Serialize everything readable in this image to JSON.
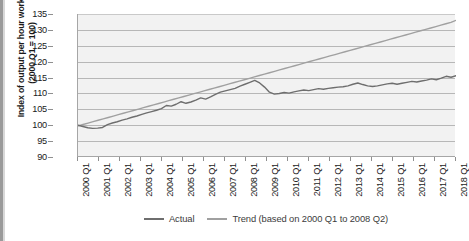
{
  "chart_data": {
    "type": "line",
    "title": "",
    "xlabel": "",
    "ylabel": "Index of output per hour worked (2000 Q1 = 100)",
    "ylabel_line1": "Index of output per hour worked",
    "ylabel_line2": "(2000 Q1 = 100)",
    "ylim": [
      90,
      135
    ],
    "yticks": [
      90,
      95,
      100,
      105,
      110,
      115,
      120,
      125,
      130,
      135
    ],
    "xlim": [
      "2000 Q1",
      "2018 Q1"
    ],
    "xticks": [
      "2000 Q1",
      "2001 Q1",
      "2002 Q1",
      "2003 Q1",
      "2004 Q1",
      "2005 Q1",
      "2006 Q1",
      "2007 Q1",
      "2008 Q1",
      "2009 Q1",
      "2010 Q1",
      "2011 Q1",
      "2012 Q1",
      "2013 Q1",
      "2014 Q1",
      "2015 Q1",
      "2016 Q1",
      "2017 Q1",
      "2018 Q1"
    ],
    "grid": true,
    "grid_axis": "y",
    "legend_position": "bottom-center",
    "plot_background": "#f2f2f2",
    "series": [
      {
        "name": "Actual",
        "color": "#6e6e6e",
        "x_start": "2000 Q1",
        "x_step_label": "quarterly",
        "values": [
          100.0,
          99.6,
          99.2,
          99.0,
          99.1,
          99.3,
          100.2,
          100.7,
          101.1,
          101.6,
          102.0,
          102.5,
          102.9,
          103.4,
          103.9,
          104.3,
          104.7,
          105.2,
          106.2,
          106.0,
          106.6,
          107.4,
          106.9,
          107.3,
          107.9,
          108.6,
          108.2,
          108.9,
          109.7,
          110.4,
          110.8,
          111.2,
          111.6,
          112.3,
          112.9,
          113.5,
          114.1,
          113.3,
          112.0,
          110.4,
          109.8,
          110.0,
          110.3,
          110.1,
          110.5,
          110.8,
          111.1,
          110.9,
          111.2,
          111.5,
          111.3,
          111.6,
          111.8,
          112.0,
          112.1,
          112.4,
          112.9,
          113.3,
          112.8,
          112.4,
          112.2,
          112.4,
          112.7,
          113.0,
          113.2,
          112.9,
          113.2,
          113.5,
          113.8,
          113.6,
          113.9,
          114.2,
          114.6,
          114.3,
          114.8,
          115.4,
          115.1,
          115.6
        ]
      },
      {
        "name": "Trend (based on 2000 Q1 to 2008 Q2)",
        "color": "#a0a0a0",
        "x_start": "2000 Q1",
        "description": "Linear trend extrapolated from 2000 Q1 to 2008 Q2, continuing to 2018 Q1",
        "start_value": 99.8,
        "end_value": 133.0,
        "values": [
          99.8,
          100.24,
          100.68,
          101.12,
          101.56,
          102.0,
          102.44,
          102.88,
          103.32,
          103.76,
          104.2,
          104.64,
          105.08,
          105.52,
          105.96,
          106.4,
          106.84,
          107.28,
          107.72,
          108.16,
          108.6,
          109.04,
          109.48,
          109.92,
          110.36,
          110.8,
          111.24,
          111.68,
          112.12,
          112.56,
          113.0,
          113.44,
          113.88,
          114.32,
          114.76,
          115.2,
          115.64,
          116.08,
          116.52,
          116.96,
          117.4,
          117.84,
          118.28,
          118.72,
          119.16,
          119.6,
          120.04,
          120.48,
          120.92,
          121.36,
          121.8,
          122.24,
          122.68,
          123.12,
          123.56,
          124.0,
          124.44,
          124.88,
          125.32,
          125.76,
          126.2,
          126.64,
          127.08,
          127.52,
          127.96,
          128.4,
          128.84,
          129.28,
          129.72,
          130.16,
          130.6,
          131.04,
          131.48,
          131.92,
          132.36,
          133.0
        ]
      }
    ],
    "legend": [
      {
        "label": "Actual",
        "color": "#6e6e6e"
      },
      {
        "label": "Trend (based on 2000 Q1 to 2008 Q2)",
        "color": "#a0a0a0"
      }
    ]
  }
}
